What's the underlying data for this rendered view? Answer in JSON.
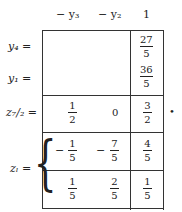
{
  "header": {
    "col1": "− y₃",
    "col2": "− y₂",
    "col3": "1"
  },
  "rows": {
    "y4": {
      "label": "y₄ =",
      "rhs": {
        "num": "27",
        "den": "5"
      }
    },
    "y1": {
      "label": "y₁ =",
      "rhs": {
        "num": "36",
        "den": "5"
      }
    },
    "z7_2": {
      "label": "z₇/₂ =",
      "c1": {
        "num": "1",
        "den": "2"
      },
      "c2": "0",
      "rhs": {
        "num": "3",
        "den": "2"
      }
    },
    "zl_a": {
      "c1": {
        "sign": "−",
        "num": "1",
        "den": "5"
      },
      "c2": {
        "sign": "−",
        "num": "7",
        "den": "5"
      },
      "rhs": {
        "num": "4",
        "den": "5"
      }
    },
    "zl_b": {
      "c1": {
        "num": "1",
        "den": "5"
      },
      "c2": {
        "num": "2",
        "den": "5"
      },
      "rhs": {
        "num": "1",
        "den": "5"
      }
    }
  },
  "zl_label": "zₗ =",
  "trailing": "•"
}
